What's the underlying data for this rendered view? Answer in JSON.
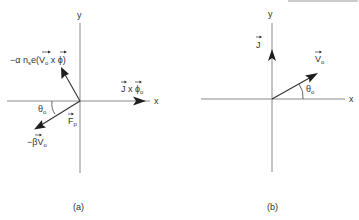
{
  "figure": {
    "colors": {
      "axis": "#8a8a8a",
      "vector": "#333333",
      "arrowhead": "#1e1e1e",
      "text": "#333333"
    },
    "panel_a": {
      "caption": "(a)",
      "axis_x_label": "x",
      "axis_y_label": "y",
      "vectors": [
        {
          "name": "lorentz-like-force",
          "label_main": "−α n",
          "label_sub_s": "s",
          "label_rest": "e(V",
          "label_sub_0": "o",
          "label_tail": " x ϕ)"
        },
        {
          "name": "j-cross-phi",
          "label_main": "J x ϕ",
          "label_sub": "o"
        },
        {
          "name": "friction-force",
          "label_main": "−βV",
          "label_sub": "o"
        }
      ],
      "net_force_label": "F",
      "net_force_sub": "p",
      "angle_label": "θ",
      "angle_sub": "o"
    },
    "panel_b": {
      "caption": "(b)",
      "axis_x_label": "x",
      "axis_y_label": "y",
      "current_label": "J",
      "velocity_label": "V",
      "velocity_sub": "o",
      "angle_label": "θ",
      "angle_sub": "o"
    }
  }
}
